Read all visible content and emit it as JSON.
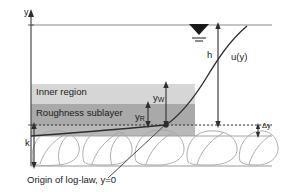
{
  "figure": {
    "axis_label": "y",
    "labels": {
      "inner_region": "Inner region",
      "roughness_sublayer": "Roughness sublayer",
      "flow_depth": "h",
      "velocity_profile": "u(y)",
      "roughness_height": "k",
      "origin_note": "Origin of log-law, y=0",
      "delta_y": "Δy",
      "y_w_base": "y",
      "y_w_sub": "W",
      "y_r_base": "y",
      "y_r_sub": "R"
    },
    "colors": {
      "inner_region_band": "#d4d4d4",
      "roughness_sublayer_band": "#a8a8a8",
      "line": "#3f3f3f",
      "stone_outline": "#9a9a9a",
      "text": "#1a1a1a",
      "background": "#ffffff"
    },
    "geometry": {
      "y_axis_x": 31,
      "water_surface_y": 25,
      "inner_region_top_y": 84,
      "roughness_top_y": 104,
      "log_law_origin_y": 125,
      "bed_bottom_y": 166,
      "band_right_x": 195,
      "diagram_right_x": 272
    },
    "icons": {
      "water_surface": "water-surface-symbol"
    }
  }
}
